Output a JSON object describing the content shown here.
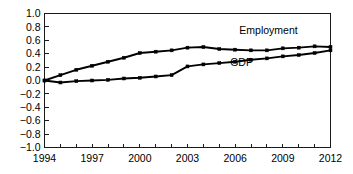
{
  "chart_data": {
    "type": "line",
    "title": "",
    "subtitle": "",
    "xlabel": "",
    "ylabel": "",
    "xlim": [
      1994,
      2012
    ],
    "ylim": [
      -1.0,
      1.0
    ],
    "grid": false,
    "legend_position": "inline-annotations",
    "x": [
      1994,
      1995,
      1996,
      1997,
      1998,
      1999,
      2000,
      2001,
      2002,
      2003,
      2004,
      2005,
      2006,
      2007,
      2008,
      2009,
      2010,
      2011,
      2012
    ],
    "y_ticks": [
      -1.0,
      -0.8,
      -0.6,
      -0.4,
      -0.2,
      0.0,
      0.2,
      0.4,
      0.6,
      0.8,
      1.0
    ],
    "y_tick_labels": [
      "-1.0",
      "-0.8",
      "-0.6",
      "-0.4",
      "-0.2",
      "0.0",
      "0.2",
      "0.4",
      "0.6",
      "0.8",
      "1.0"
    ],
    "x_ticks": [
      1994,
      1995,
      1996,
      1997,
      1998,
      1999,
      2000,
      2001,
      2002,
      2003,
      2004,
      2005,
      2006,
      2007,
      2008,
      2009,
      2010,
      2011,
      2012
    ],
    "x_tick_labels_shown": [
      "1994",
      "1997",
      "2000",
      "2003",
      "2006",
      "2009",
      "2012"
    ],
    "x_tick_labels_shown_values": [
      1994,
      1997,
      2000,
      2003,
      2006,
      2009,
      2012
    ],
    "series": [
      {
        "name": "Employment",
        "color": "#000000",
        "marker": "square",
        "label_x": 2008.1,
        "label_y": 0.7,
        "values": [
          0.0,
          0.08,
          0.16,
          0.22,
          0.28,
          0.34,
          0.41,
          0.43,
          0.45,
          0.49,
          0.5,
          0.47,
          0.46,
          0.45,
          0.45,
          0.48,
          0.49,
          0.51,
          0.5
        ]
      },
      {
        "name": "GDP",
        "color": "#000000",
        "marker": "square",
        "label_x": 2006.4,
        "label_y": 0.21,
        "values": [
          0.0,
          -0.03,
          -0.01,
          0.0,
          0.01,
          0.03,
          0.04,
          0.06,
          0.08,
          0.21,
          0.24,
          0.26,
          0.28,
          0.31,
          0.33,
          0.36,
          0.38,
          0.41,
          0.45
        ]
      }
    ]
  }
}
